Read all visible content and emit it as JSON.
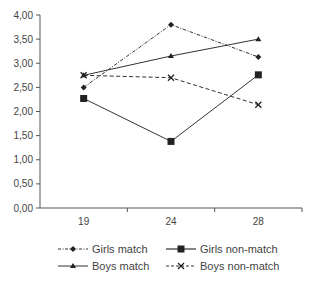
{
  "chart_data": {
    "type": "line",
    "title": "",
    "xlabel": "",
    "ylabel": "",
    "categories": [
      "19",
      "24",
      "28"
    ],
    "ylim": [
      0,
      4
    ],
    "y_ticks": [
      "0,00",
      "0,50",
      "1,00",
      "1,50",
      "2,00",
      "2,50",
      "3,00",
      "3,50",
      "4,00"
    ],
    "grid": false,
    "legend_position": "bottom",
    "series": [
      {
        "name": "Girls match",
        "values": [
          2.5,
          3.8,
          3.13
        ],
        "marker": "diamond",
        "line": "dash-dot"
      },
      {
        "name": "Girls non-match",
        "values": [
          2.27,
          1.38,
          2.76
        ],
        "marker": "square",
        "line": "solid"
      },
      {
        "name": "Boys match",
        "values": [
          2.75,
          3.15,
          3.5
        ],
        "marker": "triangle",
        "line": "solid"
      },
      {
        "name": "Boys non-match",
        "values": [
          2.75,
          2.7,
          2.14
        ],
        "marker": "x",
        "line": "dashed"
      }
    ]
  },
  "legend": {
    "girls_match": "Girls match",
    "girls_nonmatch": "Girls non-match",
    "boys_match": "Boys match",
    "boys_nonmatch": "Boys non-match"
  },
  "colors": {
    "line": "#333333",
    "axis": "#555555",
    "text": "#444444"
  }
}
